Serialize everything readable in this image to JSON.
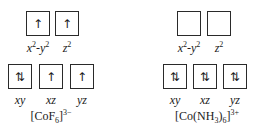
{
  "diagrams": [
    {
      "title": "[CoF6]3−",
      "title_parts": {
        "pre": "[CoF",
        "sub": "6",
        "post": "]",
        "sup": "3−"
      },
      "eg": [
        {
          "label": "x2-y2",
          "occupancy": "↑"
        },
        {
          "label": "z2",
          "occupancy": "↑"
        }
      ],
      "t2g": [
        {
          "label": "xy",
          "occupancy": "⇅"
        },
        {
          "label": "xz",
          "occupancy": "↑"
        },
        {
          "label": "yz",
          "occupancy": "↑"
        }
      ]
    },
    {
      "title": "[Co(NH3)6]3+",
      "title_parts": {
        "pre": "[Co(NH",
        "sub1": "3",
        "mid": ")",
        "sub2": "6",
        "post": "]",
        "sup": "3+"
      },
      "eg": [
        {
          "label": "x2-y2",
          "occupancy": ""
        },
        {
          "label": "z2",
          "occupancy": ""
        }
      ],
      "t2g": [
        {
          "label": "xy",
          "occupancy": "⇅"
        },
        {
          "label": "xz",
          "occupancy": "⇅"
        },
        {
          "label": "yz",
          "occupancy": "⇅"
        }
      ]
    }
  ],
  "labels": {
    "x2y2_base": "x",
    "x2y2_exp": "2",
    "x2y2_mid": "-y",
    "z_base": "z",
    "exp": "2"
  }
}
